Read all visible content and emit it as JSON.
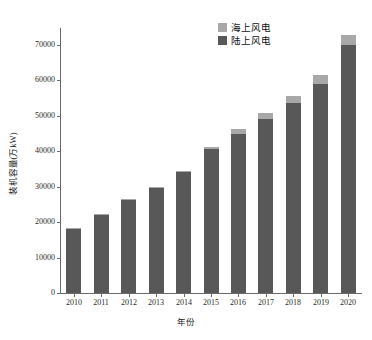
{
  "chart_data": {
    "type": "bar",
    "stacked": true,
    "title": "",
    "subtitle": "",
    "xlabel": "年份",
    "ylabel": "装机容量(万kW)",
    "categories": [
      "2010",
      "2011",
      "2012",
      "2013",
      "2014",
      "2015",
      "2016",
      "2017",
      "2018",
      "2019",
      "2020"
    ],
    "series": [
      {
        "name": "陆上风电",
        "color": "#585858",
        "values": [
          17950,
          21950,
          26200,
          29500,
          34200,
          40700,
          44800,
          49200,
          53700,
          59100,
          69900
        ]
      },
      {
        "name": "海上风电",
        "color": "#a8a8a8",
        "values": [
          100,
          130,
          180,
          250,
          400,
          500,
          1500,
          1700,
          2100,
          2500,
          2700
        ]
      }
    ],
    "totals": [
      18050,
      22080,
      26380,
      29750,
      34600,
      41200,
      46300,
      50900,
      55800,
      61600,
      72600
    ],
    "ylim": [
      0,
      75000
    ],
    "yticks": [
      0,
      10000,
      20000,
      30000,
      40000,
      50000,
      60000,
      70000
    ],
    "ytick_labels": [
      "0",
      "10000",
      "20000",
      "30000",
      "40000",
      "50000",
      "60000",
      "70000"
    ],
    "grid": false,
    "legend_position": "top-right",
    "legend_entries": [
      {
        "label": "海上风电",
        "color": "#a8a8a8"
      },
      {
        "label": "陆上风电",
        "color": "#585858"
      }
    ]
  },
  "axes": {
    "y_title": "装机容量(万kW)",
    "x_title": "年份"
  }
}
